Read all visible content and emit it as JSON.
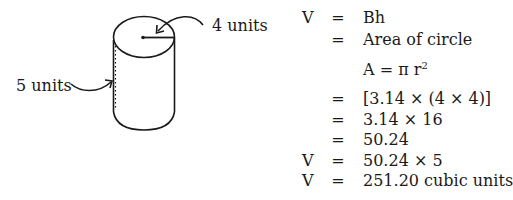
{
  "figure": {
    "radius_label": "4 units",
    "height_label": "5 units"
  },
  "solution": {
    "rows": [
      {
        "lhs": "V",
        "eq": "=",
        "rhs": "Bh"
      },
      {
        "lhs": "",
        "eq": "=",
        "rhs": "Area of circle"
      },
      {
        "lhs": "",
        "eq": "",
        "rhs_base": "A = π r",
        "rhs_sup": "2"
      },
      {
        "lhs": "",
        "eq": "=",
        "rhs": "[3.14 × (4 × 4)]"
      },
      {
        "lhs": "",
        "eq": "=",
        "rhs": "3.14 × 16"
      },
      {
        "lhs": "",
        "eq": "=",
        "rhs": "50.24"
      },
      {
        "lhs": "V",
        "eq": "=",
        "rhs": "50.24 × 5"
      },
      {
        "lhs": "V",
        "eq": "=",
        "rhs": "251.20 cubic units"
      }
    ]
  }
}
